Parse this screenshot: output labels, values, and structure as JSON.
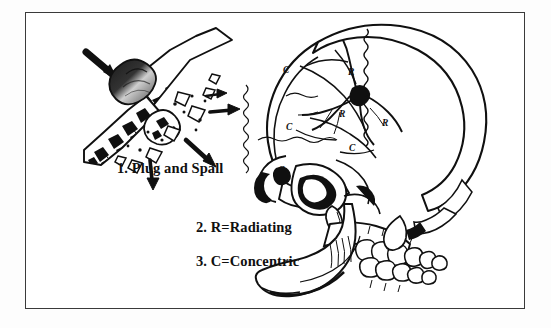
{
  "figure": {
    "background_color": "#ffffff",
    "ink_color": "#101010",
    "border_color": "#3a3a3a"
  },
  "legend": {
    "items": [
      {
        "number": "1.",
        "text": "Plug and Spall",
        "label": "1.  Plug and Spall"
      },
      {
        "number": "2.",
        "text": "R=Radiating",
        "label": "2.  R=Radiating"
      },
      {
        "number": "3.",
        "text": "C=Concentric",
        "label": "3.  C=Concentric"
      }
    ]
  },
  "plug_and_spall_diagram": {
    "name": "plug-and-spall-inset",
    "description": "Bullet passing obliquely through a cross-section of cranial bone, driving a plug of bone inward and spalling fragments outward",
    "bullet_label": "bullet",
    "bone_label": "cranial bone cross-section",
    "arrow_count": 4
  },
  "skull_diagram": {
    "name": "lateral-skull",
    "view": "left lateral",
    "entrance_wound_label": "entrance wound",
    "suture_label": "coronal suture",
    "fracture_markers": [
      {
        "code": "R",
        "type": "radiating",
        "x": 352,
        "y": 72
      },
      {
        "code": "R",
        "type": "radiating",
        "x": 343,
        "y": 114
      },
      {
        "code": "R",
        "type": "radiating",
        "x": 386,
        "y": 123
      },
      {
        "code": "C",
        "type": "concentric",
        "x": 286,
        "y": 70
      },
      {
        "code": "C",
        "type": "concentric",
        "x": 289,
        "y": 127
      },
      {
        "code": "C",
        "type": "concentric",
        "x": 352,
        "y": 148
      },
      {
        "code": "C",
        "type": "concentric",
        "x": 281,
        "y": 170
      }
    ]
  }
}
